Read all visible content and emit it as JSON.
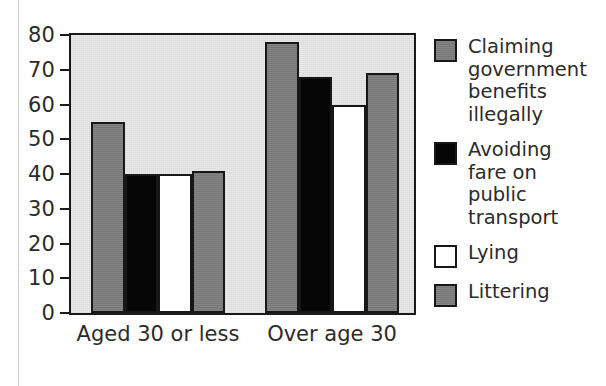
{
  "chart_data": {
    "type": "bar",
    "title": "",
    "xlabel": "",
    "ylabel": "",
    "ylim": [
      0,
      80
    ],
    "yticks": [
      0,
      10,
      20,
      30,
      40,
      50,
      60,
      70,
      80
    ],
    "grid": false,
    "legend_position": "right",
    "categories": [
      "Aged 30 or less",
      "Over age 30"
    ],
    "series": [
      {
        "name": "Claiming government benefits illegally",
        "legend_label": "Claiming\ngovernment\nbenefits\nillegally",
        "swatch": "gray",
        "color": "#7d7d7d",
        "values": [
          55,
          78
        ]
      },
      {
        "name": "Avoiding fare on public transport",
        "legend_label": "Avoiding\nfare on\npublic\ntransport",
        "swatch": "black",
        "color": "#060606",
        "values": [
          40,
          68
        ]
      },
      {
        "name": "Lying",
        "legend_label": "Lying",
        "swatch": "white",
        "color": "#ffffff",
        "values": [
          40,
          60
        ]
      },
      {
        "name": "Littering",
        "legend_label": "Littering",
        "swatch": "gray",
        "color": "#7d7d7d",
        "values": [
          41,
          69
        ]
      }
    ]
  },
  "style": {
    "plot_background": "#e9e9e9",
    "axis_color": "#1a1a1a",
    "text_color": "#2b2b2b",
    "page_background": "#ffffff"
  }
}
